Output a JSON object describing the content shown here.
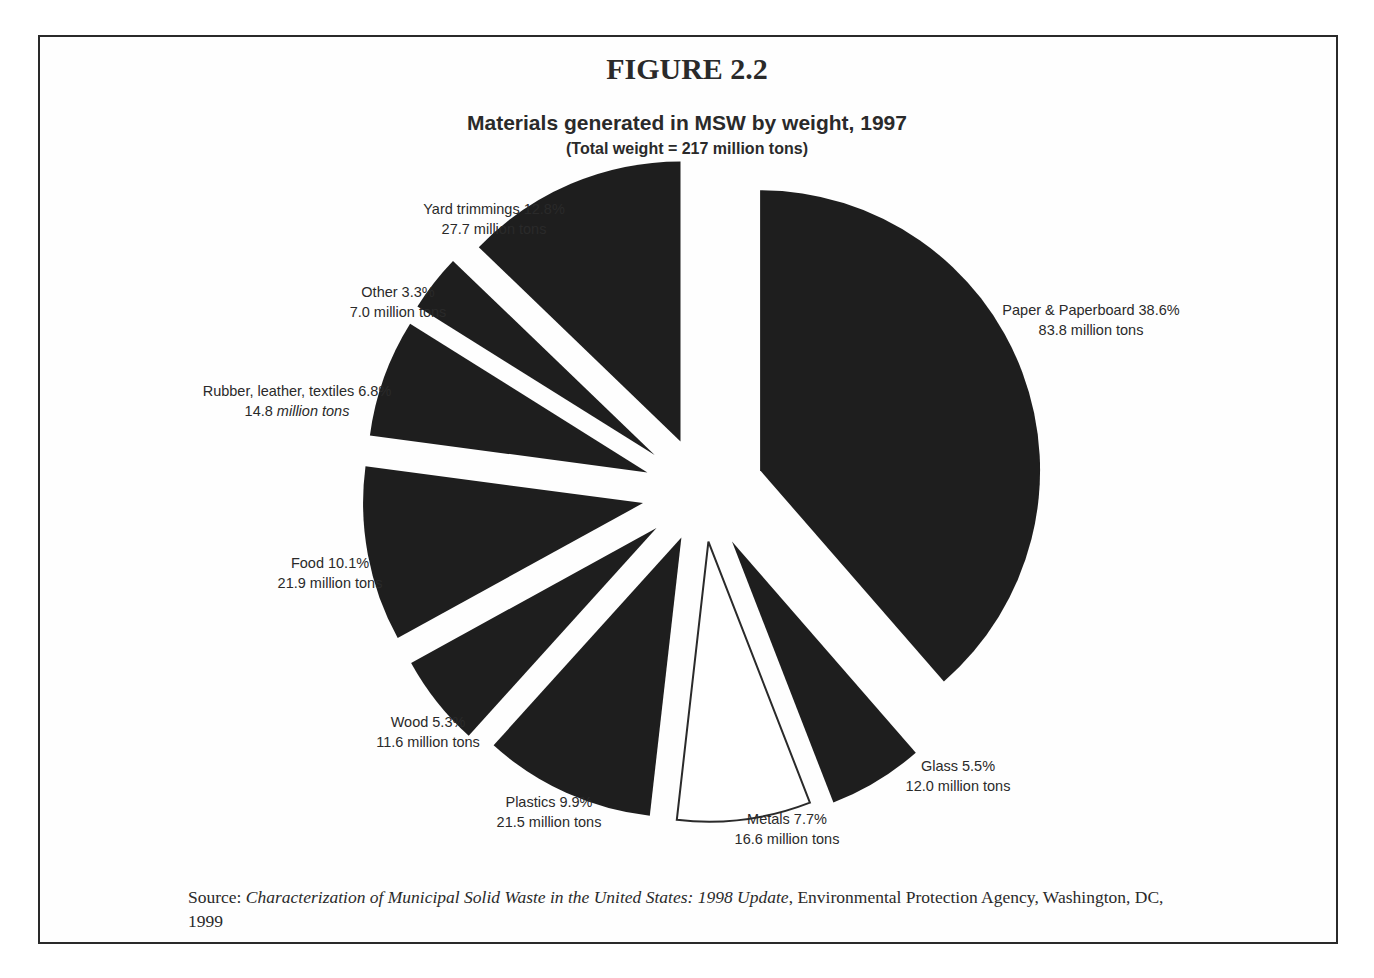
{
  "figure": {
    "number_label": "FIGURE 2.2",
    "title": "Materials generated in MSW by weight, 1997",
    "subtitle": "(Total  weight = 217 million tons)"
  },
  "source": {
    "prefix": "Source: ",
    "italic_title": "Characterization of Municipal Solid Waste in the United States: 1998 Update",
    "suffix": ", Environmental Protection Agency, Washington, DC, 1999"
  },
  "colors": {
    "slice_fill": "#1e1e1e",
    "highlight_fill": "#ffffff",
    "ink": "#2a2a2a",
    "frame": "#2a2a2a"
  },
  "chart_data": {
    "type": "pie",
    "title": "Materials generated in MSW by weight, 1997",
    "subtitle": "(Total  weight = 217 million tons)",
    "total": 217,
    "unit": "million tons",
    "exploded": true,
    "start_angle_deg": 0,
    "direction": "clockwise",
    "categories": [
      "Paper & Paperboard",
      "Glass",
      "Metals",
      "Plastics",
      "Wood",
      "Food",
      "Rubber, leather, textiles",
      "Other",
      "Yard trimmings"
    ],
    "percent": [
      38.6,
      5.5,
      7.7,
      9.9,
      5.3,
      10.1,
      6.8,
      3.3,
      12.8
    ],
    "values": [
      83.8,
      12.0,
      16.6,
      21.5,
      11.6,
      21.9,
      14.8,
      7.0,
      27.7
    ],
    "slices": [
      {
        "name": "Paper & Paperboard",
        "percent": 38.6,
        "value": 83.8,
        "line1": "Paper & Paperboard 38.6%",
        "line2": "83.8 million tons",
        "fill": "dark",
        "label_x": 1091,
        "label_y": 300
      },
      {
        "name": "Glass",
        "percent": 5.5,
        "value": 12.0,
        "line1": "Glass 5.5%",
        "line2": "12.0 million tons",
        "fill": "dark",
        "label_x": 958,
        "label_y": 756
      },
      {
        "name": "Metals",
        "percent": 7.7,
        "value": 16.6,
        "line1": "Metals 7.7%",
        "line2": "16.6 million tons",
        "fill": "white",
        "label_x": 787,
        "label_y": 809
      },
      {
        "name": "Plastics",
        "percent": 9.9,
        "value": 21.5,
        "line1": "Plastics 9.9%",
        "line2": "21.5 million tons",
        "fill": "dark",
        "label_x": 549,
        "label_y": 792
      },
      {
        "name": "Wood",
        "percent": 5.3,
        "value": 11.6,
        "line1": "Wood 5.3%",
        "line2": "11.6 million tons",
        "fill": "dark",
        "label_x": 428,
        "label_y": 712
      },
      {
        "name": "Food",
        "percent": 10.1,
        "value": 21.9,
        "line1": "Food 10.1%",
        "line2": "21.9 million tons",
        "fill": "dark",
        "label_x": 330,
        "label_y": 553
      },
      {
        "name": "Rubber, leather, textiles",
        "percent": 6.8,
        "value": 14.8,
        "line1": "Rubber, leather, textiles 6.8%",
        "line2": "14.8 million tons",
        "line2_italic": "million tons",
        "fill": "dark",
        "label_x": 297,
        "label_y": 381
      },
      {
        "name": "Other",
        "percent": 3.3,
        "value": 7.0,
        "line1": "Other 3.3%",
        "line2": "7.0 million tons",
        "fill": "dark",
        "label_x": 398,
        "label_y": 282
      },
      {
        "name": "Yard trimmings",
        "percent": 12.8,
        "value": 27.7,
        "line1": "Yard trimmings 12.8%",
        "line2": "27.7 million tons",
        "fill": "dark",
        "label_x": 494,
        "label_y": 199
      }
    ],
    "legend": "none (direct labels)"
  }
}
